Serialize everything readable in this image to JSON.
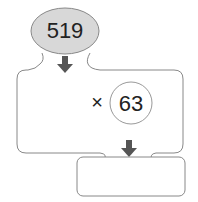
{
  "diagram": {
    "input_value": "519",
    "operator": "×",
    "operand": "63",
    "result_value": "",
    "colors": {
      "ellipse_fill": "#d8d8d8",
      "stroke": "#888888",
      "arrow": "#555555"
    }
  }
}
